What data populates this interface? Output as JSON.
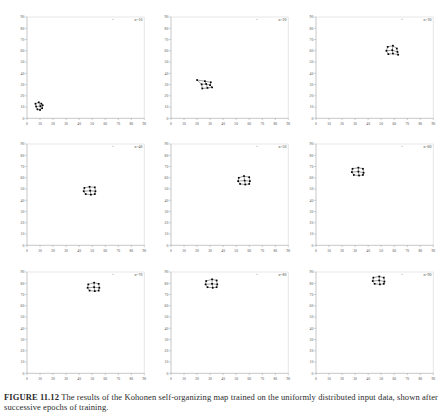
{
  "figure": {
    "caption_label": "FIGURE 11.12",
    "caption_text": "The results of the Kohonen self-organizing map trained on the uniformly distributed input data, shown after successive epochs of training.",
    "caption_full": "FIGURE 11.12 The results of the Kohonen self-organizing map trained on the uniformly distributed input data, shown after successive epochs of training."
  },
  "chart_data": {
    "type": "scatter",
    "title": "FIGURE 11.12",
    "xlabel": "",
    "ylabel": "",
    "xlim": [
      0,
      90
    ],
    "ylim": [
      0,
      90
    ],
    "grid": false,
    "legend": "none",
    "xticks": [
      0,
      10,
      20,
      30,
      40,
      50,
      60,
      70,
      80,
      90
    ],
    "yticks": [
      0,
      10,
      20,
      30,
      40,
      50,
      60,
      70,
      80,
      90
    ],
    "tick_labels_visible": true,
    "panel_layout": {
      "rows": 3,
      "cols": 3
    },
    "panels": [
      {
        "index": 1,
        "label": "n=10",
        "marker_size": 2,
        "line_color": "#1a1a1a",
        "point_color": "#000000",
        "stray_point": {
          "x": 66,
          "y": 88
        },
        "nodes": [
          {
            "x": 6.5,
            "y": 13.0
          },
          {
            "x": 9.0,
            "y": 14.2
          },
          {
            "x": 11.0,
            "y": 13.0
          },
          {
            "x": 7.0,
            "y": 10.5
          },
          {
            "x": 10.3,
            "y": 10.8
          },
          {
            "x": 12.0,
            "y": 11.6
          },
          {
            "x": 8.0,
            "y": 8.0
          },
          {
            "x": 10.0,
            "y": 7.4
          },
          {
            "x": 11.6,
            "y": 9.0
          }
        ],
        "edges": [
          [
            0,
            1
          ],
          [
            1,
            2
          ],
          [
            0,
            3
          ],
          [
            1,
            4
          ],
          [
            2,
            5
          ],
          [
            3,
            4
          ],
          [
            4,
            5
          ],
          [
            3,
            6
          ],
          [
            4,
            7
          ],
          [
            5,
            8
          ],
          [
            6,
            7
          ],
          [
            7,
            8
          ]
        ]
      },
      {
        "index": 2,
        "label": "n=20",
        "marker_size": 2,
        "line_color": "#1a1a1a",
        "point_color": "#000000",
        "stray_point": {
          "x": 66,
          "y": 88
        },
        "nodes": [
          {
            "x": 20.0,
            "y": 34.0
          },
          {
            "x": 26.0,
            "y": 33.0
          },
          {
            "x": 30.5,
            "y": 32.0
          },
          {
            "x": 23.5,
            "y": 30.2
          },
          {
            "x": 27.0,
            "y": 30.5
          },
          {
            "x": 30.0,
            "y": 29.5
          },
          {
            "x": 24.0,
            "y": 26.5
          },
          {
            "x": 28.0,
            "y": 27.0
          },
          {
            "x": 31.5,
            "y": 27.5
          }
        ],
        "edges": [
          [
            0,
            1
          ],
          [
            1,
            2
          ],
          [
            0,
            3
          ],
          [
            1,
            4
          ],
          [
            2,
            5
          ],
          [
            3,
            4
          ],
          [
            4,
            5
          ],
          [
            3,
            6
          ],
          [
            4,
            7
          ],
          [
            5,
            8
          ],
          [
            6,
            7
          ],
          [
            7,
            8
          ]
        ]
      },
      {
        "index": 3,
        "label": "n=30",
        "marker_size": 2,
        "line_color": "#1a1a1a",
        "point_color": "#000000",
        "stray_point": {
          "x": 66,
          "y": 88
        },
        "nodes": [
          {
            "x": 55.0,
            "y": 63.5
          },
          {
            "x": 59.0,
            "y": 64.5
          },
          {
            "x": 62.0,
            "y": 62.0
          },
          {
            "x": 54.0,
            "y": 60.0
          },
          {
            "x": 58.5,
            "y": 60.5
          },
          {
            "x": 62.5,
            "y": 59.0
          },
          {
            "x": 55.5,
            "y": 57.0
          },
          {
            "x": 59.0,
            "y": 57.5
          },
          {
            "x": 63.0,
            "y": 56.5
          }
        ],
        "edges": [
          [
            0,
            1
          ],
          [
            1,
            2
          ],
          [
            0,
            3
          ],
          [
            1,
            4
          ],
          [
            2,
            5
          ],
          [
            3,
            4
          ],
          [
            4,
            5
          ],
          [
            3,
            6
          ],
          [
            4,
            7
          ],
          [
            5,
            8
          ],
          [
            6,
            7
          ],
          [
            7,
            8
          ]
        ]
      },
      {
        "index": 4,
        "label": "n=40",
        "marker_size": 2,
        "line_color": "#1a1a1a",
        "point_color": "#000000",
        "stray_point": {
          "x": 66,
          "y": 88
        },
        "nodes": [
          {
            "x": 44.0,
            "y": 51.0
          },
          {
            "x": 48.0,
            "y": 52.0
          },
          {
            "x": 52.0,
            "y": 51.5
          },
          {
            "x": 43.5,
            "y": 48.0
          },
          {
            "x": 48.5,
            "y": 48.5
          },
          {
            "x": 52.5,
            "y": 48.0
          },
          {
            "x": 45.0,
            "y": 45.5
          },
          {
            "x": 49.0,
            "y": 45.0
          },
          {
            "x": 52.0,
            "y": 45.5
          }
        ],
        "edges": [
          [
            0,
            1
          ],
          [
            1,
            2
          ],
          [
            0,
            3
          ],
          [
            1,
            4
          ],
          [
            2,
            5
          ],
          [
            3,
            4
          ],
          [
            4,
            5
          ],
          [
            3,
            6
          ],
          [
            4,
            7
          ],
          [
            5,
            8
          ],
          [
            6,
            7
          ],
          [
            7,
            8
          ]
        ]
      },
      {
        "index": 5,
        "label": "n=50",
        "marker_size": 2,
        "line_color": "#1a1a1a",
        "point_color": "#000000",
        "stray_point": {
          "x": 66,
          "y": 88
        },
        "nodes": [
          {
            "x": 52.0,
            "y": 60.0
          },
          {
            "x": 56.0,
            "y": 61.5
          },
          {
            "x": 60.0,
            "y": 60.5
          },
          {
            "x": 51.5,
            "y": 57.0
          },
          {
            "x": 56.5,
            "y": 57.5
          },
          {
            "x": 60.5,
            "y": 57.0
          },
          {
            "x": 53.0,
            "y": 54.5
          },
          {
            "x": 57.0,
            "y": 54.0
          },
          {
            "x": 60.0,
            "y": 54.5
          }
        ],
        "edges": [
          [
            0,
            1
          ],
          [
            1,
            2
          ],
          [
            0,
            3
          ],
          [
            1,
            4
          ],
          [
            2,
            5
          ],
          [
            3,
            4
          ],
          [
            4,
            5
          ],
          [
            3,
            6
          ],
          [
            4,
            7
          ],
          [
            5,
            8
          ],
          [
            6,
            7
          ],
          [
            7,
            8
          ]
        ]
      },
      {
        "index": 6,
        "label": "n=60",
        "marker_size": 2,
        "line_color": "#1a1a1a",
        "point_color": "#000000",
        "stray_point": {
          "x": 66,
          "y": 88
        },
        "nodes": [
          {
            "x": 28.0,
            "y": 68.0
          },
          {
            "x": 32.5,
            "y": 69.0
          },
          {
            "x": 36.0,
            "y": 68.0
          },
          {
            "x": 27.5,
            "y": 65.0
          },
          {
            "x": 32.5,
            "y": 65.5
          },
          {
            "x": 36.5,
            "y": 64.5
          },
          {
            "x": 29.0,
            "y": 62.5
          },
          {
            "x": 33.0,
            "y": 62.0
          },
          {
            "x": 36.0,
            "y": 62.5
          }
        ],
        "edges": [
          [
            0,
            1
          ],
          [
            1,
            2
          ],
          [
            0,
            3
          ],
          [
            1,
            4
          ],
          [
            2,
            5
          ],
          [
            3,
            4
          ],
          [
            4,
            5
          ],
          [
            3,
            6
          ],
          [
            4,
            7
          ],
          [
            5,
            8
          ],
          [
            6,
            7
          ],
          [
            7,
            8
          ]
        ]
      },
      {
        "index": 7,
        "label": "n=70",
        "marker_size": 2,
        "line_color": "#1a1a1a",
        "point_color": "#000000",
        "stray_point": {
          "x": 66,
          "y": 88
        },
        "nodes": [
          {
            "x": 47.0,
            "y": 79.0
          },
          {
            "x": 51.5,
            "y": 80.5
          },
          {
            "x": 55.0,
            "y": 79.5
          },
          {
            "x": 46.5,
            "y": 76.0
          },
          {
            "x": 51.5,
            "y": 76.5
          },
          {
            "x": 55.5,
            "y": 76.0
          },
          {
            "x": 48.0,
            "y": 73.5
          },
          {
            "x": 52.0,
            "y": 73.0
          },
          {
            "x": 55.0,
            "y": 73.5
          }
        ],
        "edges": [
          [
            0,
            1
          ],
          [
            1,
            2
          ],
          [
            0,
            3
          ],
          [
            1,
            4
          ],
          [
            2,
            5
          ],
          [
            3,
            4
          ],
          [
            4,
            5
          ],
          [
            3,
            6
          ],
          [
            4,
            7
          ],
          [
            5,
            8
          ],
          [
            6,
            7
          ],
          [
            7,
            8
          ]
        ]
      },
      {
        "index": 8,
        "label": "n=80",
        "marker_size": 2,
        "line_color": "#1a1a1a",
        "point_color": "#000000",
        "stray_point": {
          "x": 66,
          "y": 88
        },
        "nodes": [
          {
            "x": 27.0,
            "y": 82.0
          },
          {
            "x": 31.5,
            "y": 83.5
          },
          {
            "x": 35.0,
            "y": 82.5
          },
          {
            "x": 26.5,
            "y": 79.0
          },
          {
            "x": 31.5,
            "y": 79.5
          },
          {
            "x": 35.5,
            "y": 79.0
          },
          {
            "x": 28.0,
            "y": 76.5
          },
          {
            "x": 32.0,
            "y": 76.0
          },
          {
            "x": 35.0,
            "y": 76.5
          }
        ],
        "edges": [
          [
            0,
            1
          ],
          [
            1,
            2
          ],
          [
            0,
            3
          ],
          [
            1,
            4
          ],
          [
            2,
            5
          ],
          [
            3,
            4
          ],
          [
            4,
            5
          ],
          [
            3,
            6
          ],
          [
            4,
            7
          ],
          [
            5,
            8
          ],
          [
            6,
            7
          ],
          [
            7,
            8
          ]
        ]
      },
      {
        "index": 9,
        "label": "n=90",
        "marker_size": 2,
        "line_color": "#1a1a1a",
        "point_color": "#000000",
        "stray_point": {
          "x": 66,
          "y": 88
        },
        "nodes": [
          {
            "x": 44.0,
            "y": 85.0
          },
          {
            "x": 48.5,
            "y": 86.0
          },
          {
            "x": 52.0,
            "y": 85.0
          },
          {
            "x": 43.5,
            "y": 82.0
          },
          {
            "x": 48.5,
            "y": 82.5
          },
          {
            "x": 52.5,
            "y": 81.5
          },
          {
            "x": 45.0,
            "y": 79.5
          },
          {
            "x": 49.0,
            "y": 79.0
          },
          {
            "x": 52.0,
            "y": 79.5
          }
        ],
        "edges": [
          [
            0,
            1
          ],
          [
            1,
            2
          ],
          [
            0,
            3
          ],
          [
            1,
            4
          ],
          [
            2,
            5
          ],
          [
            3,
            4
          ],
          [
            4,
            5
          ],
          [
            3,
            6
          ],
          [
            4,
            7
          ],
          [
            5,
            8
          ],
          [
            6,
            7
          ],
          [
            7,
            8
          ]
        ]
      }
    ]
  }
}
